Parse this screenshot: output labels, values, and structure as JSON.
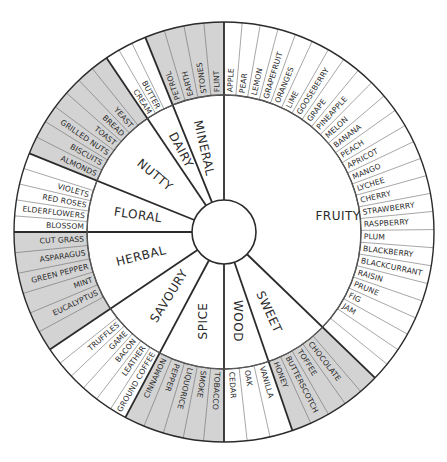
{
  "wheel": {
    "center": [
      224,
      232
    ],
    "outer_radius": 210,
    "inner_radius": 137,
    "hub_radius": 32,
    "label_font_px": 7.6,
    "colors": {
      "shaded": "#d3d3d3",
      "unshaded": "#ffffff",
      "stroke": "#2b2b2b",
      "thin_stroke": "#6b6b6b",
      "text": "#2a2a2a"
    },
    "categories": [
      {
        "name": "FRUITY",
        "start": 0,
        "end": 134,
        "shaded": false,
        "slots": 27,
        "items": [
          "APPLE",
          "PEAR",
          "LEMON",
          "GRAPEFRUIT",
          "ORANGES",
          "LIME",
          "GOOSEBERRY",
          "GRAPE",
          "PINEAPPLE",
          "MELON",
          "BANANA",
          "PEACH",
          "APRICOT",
          "MANGO",
          "LYCHEE",
          "CHERRY",
          "STRAWBERRY",
          "RASPBERRY",
          "PLUM",
          "BLACKBERRY",
          "BLACKCURRANT",
          "RAISIN",
          "PRUNE",
          "FIG",
          "JAM"
        ],
        "label_pos": [
          338,
          216
        ]
      },
      {
        "name": "SWEET",
        "start": 134,
        "end": 161,
        "shaded": true,
        "slots": 5,
        "items": [
          "",
          "CHOCOLATE",
          "TOFFEE",
          "BUTTERSCOTCH",
          "HONEY"
        ],
        "label_pos": [
          269,
          312
        ],
        "label_rotate": 65
      },
      {
        "name": "WOOD",
        "start": 161,
        "end": 180,
        "shaded": false,
        "slots": 3,
        "items": [
          "VANILLA",
          "OAK",
          "CEDAR"
        ],
        "label_pos": [
          238,
          321
        ],
        "label_rotate": 90
      },
      {
        "name": "SPICE",
        "start": 180,
        "end": 208,
        "shaded": true,
        "slots": 5,
        "items": [
          "TOBACCO",
          "SMOKE",
          "LIQUORICE",
          "PEPPER",
          "CINNAMON"
        ],
        "label_pos": [
          203,
          321
        ],
        "label_rotate": -90
      },
      {
        "name": "SAVOURY",
        "start": 208,
        "end": 236,
        "shaded": false,
        "slots": 6,
        "items": [
          "GROUND COFFEE",
          "LEATHER",
          "BACON",
          "GAME",
          "TRUFFLES",
          ""
        ],
        "label_pos": [
          169,
          296
        ],
        "label_rotate": -58
      },
      {
        "name": "HERBAL",
        "start": 236,
        "end": 270,
        "shaded": true,
        "slots": 6,
        "items": [
          "",
          "EUCALYPTUS",
          "MINT",
          "GREEN PEPPER",
          "ASPARAGUS",
          "CUT GRASS",
          "HAY"
        ],
        "label_pos": [
          141,
          256
        ],
        "label_rotate": -14
      },
      {
        "name": "FLORAL",
        "start": 270,
        "end": 292,
        "shaded": false,
        "slots": 5,
        "items": [
          "BLOSSOM",
          "ELDERFLOWERS",
          "RED ROSES",
          "VIOLETS",
          ""
        ],
        "label_pos": [
          138,
          215
        ],
        "label_rotate": 8
      },
      {
        "name": "NUTTY",
        "start": 292,
        "end": 326,
        "shaded": true,
        "slots": 7,
        "items": [
          "ALMONDS",
          "BISCUITS",
          "GRILLED NUTS",
          "TOAST",
          "BREAD",
          "YEAST",
          ""
        ],
        "label_pos": [
          155,
          175
        ],
        "label_rotate": 40
      },
      {
        "name": "DAIRY",
        "start": 326,
        "end": 338,
        "shaded": false,
        "slots": 3,
        "items": [
          "CREAM",
          "BUTTER",
          ""
        ],
        "label_pos": [
          181,
          150
        ],
        "label_rotate": 62
      },
      {
        "name": "MINERAL",
        "start": 338,
        "end": 360,
        "shaded": true,
        "slots": 4,
        "items": [
          "PETROL",
          "EARTH",
          "STONES",
          "FLINT"
        ],
        "label_pos": [
          204,
          148
        ],
        "label_rotate": 77
      }
    ]
  },
  "caption": ""
}
